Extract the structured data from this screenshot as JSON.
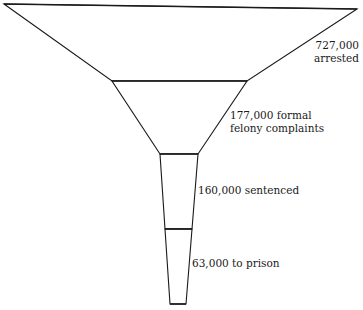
{
  "diagram": {
    "type": "funnel",
    "stroke_color": "#1a1a1a",
    "fill_color": "#ffffff",
    "stages": [
      {
        "id": "arrested",
        "line1": "727,000",
        "line2": "arrested",
        "value": 727000
      },
      {
        "id": "formal-felony-complaints",
        "line1": "177,000 formal",
        "line2": "felony complaints",
        "value": 177000
      },
      {
        "id": "sentenced",
        "line1": "160,000 sentenced",
        "line2": "",
        "value": 160000
      },
      {
        "id": "to-prison",
        "line1": "63,000 to prison",
        "line2": "",
        "value": 63000
      }
    ]
  }
}
